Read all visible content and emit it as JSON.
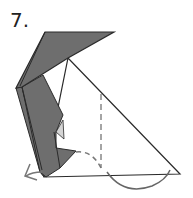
{
  "diagram": {
    "type": "origami-fold-step",
    "step_label": "7.",
    "colors": {
      "paper_colored": "#6e6e6e",
      "paper_light": "#d4d4d4",
      "paper_white": "#ffffff",
      "line": "#2a2a2a",
      "fold_line": "#888888",
      "arrow": "#777777"
    },
    "elements": [
      "top flap (colored side)",
      "large white triangle",
      "colored body flaps on left",
      "vertical dashed valley fold line",
      "dashed curved fold arrow pointing left",
      "solid curved arc arrow at bottom"
    ]
  }
}
